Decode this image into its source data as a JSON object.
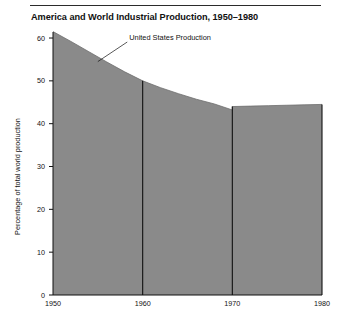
{
  "figure": {
    "title": "America and World Industrial Production, 1950–1980",
    "has_top_rule": true
  },
  "chart_data": {
    "type": "area",
    "title": "America and World Industrial Production, 1950–1980",
    "xlabel": "",
    "ylabel": "Percentage of total world production",
    "xlim": [
      1950,
      1980
    ],
    "ylim": [
      0,
      65
    ],
    "grid": false,
    "legend_position": "none",
    "fill_color": "#8a8a8a",
    "line_color": "#111111",
    "x_ticks": [
      1950,
      1960,
      1970,
      1980
    ],
    "x_tick_labels": [
      "1950",
      "1960",
      "1970",
      "1980"
    ],
    "y_ticks": [
      0,
      10,
      20,
      30,
      40,
      50,
      60
    ],
    "y_tick_labels": [
      "0",
      "10",
      "20",
      "30",
      "40",
      "50",
      "60"
    ],
    "series": [
      {
        "name": "United States Production",
        "x": [
          1950,
          1952,
          1954,
          1956,
          1958,
          1960,
          1962,
          1964,
          1966,
          1968,
          1970,
          1970,
          1972,
          1974,
          1976,
          1978,
          1980
        ],
        "values": [
          61.5,
          59.2,
          56.8,
          54.4,
          52.1,
          50.0,
          48.4,
          47.0,
          45.7,
          44.6,
          43.2,
          44.0,
          44.1,
          44.2,
          44.3,
          44.4,
          44.5
        ]
      }
    ],
    "annotations": [
      {
        "text": "United States Production",
        "x": 1958.5,
        "y": 60.0,
        "leader_to_x": 1955.0,
        "leader_to_y": 54.5
      }
    ],
    "vertical_rules_at": [
      1960,
      1970,
      1980
    ]
  },
  "axis_label_overrides": {
    "y_axis_caption": "Percentage of total world production"
  }
}
